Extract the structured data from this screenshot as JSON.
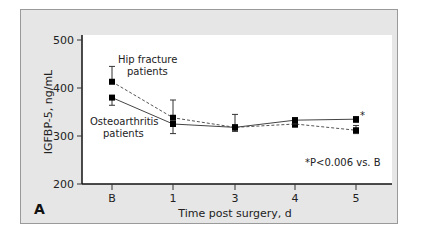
{
  "chart_data": {
    "type": "line",
    "panel_label": "A",
    "xlabel": "Time post surgery, d",
    "ylabel": "IGFBP-5, ng/mL",
    "ylim": [
      200,
      500
    ],
    "yticks": [
      200,
      300,
      400,
      500
    ],
    "categories": [
      "B",
      "1",
      "3",
      "4",
      "5"
    ],
    "series": [
      {
        "name": "Hip fracture patients",
        "style": "dashed",
        "values": [
          413,
          338,
          318,
          325,
          312
        ],
        "error_upper": [
          445,
          375,
          345,
          333,
          322
        ],
        "error_lower": [
          413,
          338,
          310,
          318,
          305
        ]
      },
      {
        "name": "Osteoarthritis patients",
        "style": "solid",
        "values": [
          380,
          325,
          318,
          333,
          335
        ],
        "error_upper": [
          380,
          325,
          318,
          338,
          340
        ],
        "error_lower": [
          364,
          305,
          310,
          325,
          328
        ]
      }
    ],
    "annotations": [
      {
        "text": "Hip fracture",
        "line2": "patients"
      },
      {
        "text": "Osteoarthritis",
        "line2": "patients"
      },
      {
        "text": "*",
        "at": "5",
        "series": "Osteoarthritis patients"
      },
      {
        "text": "*P<0.006 vs. B"
      }
    ],
    "grid": false,
    "legend_position": "inline labels"
  },
  "labels": {
    "hip_line1": "Hip fracture",
    "hip_line2": "patients",
    "oa_line1": "Osteoarthritis",
    "oa_line2": "patients",
    "asterisk": "*",
    "footnote": "*P<0.006 vs. B",
    "panel": "A",
    "xlabel": "Time post surgery, d",
    "ylabel": "IGFBP-5, ng/mL"
  }
}
